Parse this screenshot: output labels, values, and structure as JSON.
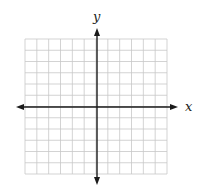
{
  "diagram": {
    "type": "coordinate-grid",
    "x_axis_label": "x",
    "y_axis_label": "y",
    "grid": {
      "columns": 12,
      "rows": 12,
      "cell_size_px": 11.8,
      "left": 25,
      "top": 39,
      "right": 167,
      "bottom": 174
    },
    "origin_px": {
      "x": 97,
      "y": 107
    },
    "colors": {
      "grid": "#c8c8c8",
      "axis": "#1a1a1a",
      "background": "#ffffff"
    }
  }
}
